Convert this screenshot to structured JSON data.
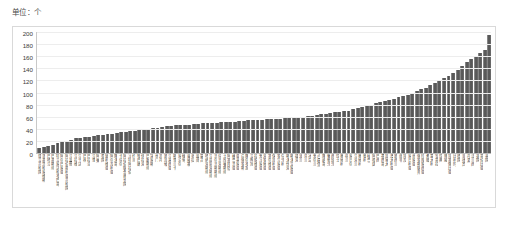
{
  "unit": {
    "label": "单位：个"
  },
  "chart_data": {
    "type": "bar",
    "title": "",
    "subtitle": "",
    "xlabel": "",
    "ylabel": "",
    "unit_note": "单位：个",
    "ylim": [
      0,
      200
    ],
    "yticks": [
      200,
      180,
      160,
      140,
      120,
      100,
      80,
      60,
      40,
      20,
      0
    ],
    "grid": true,
    "legend": "none",
    "bar_color": "#4e4e4e",
    "sorted": "ascending",
    "categories": [
      "建立共和国",
      "圣基茨和尼维斯",
      "巴哈马",
      "巴基斯坦",
      "特立尼达和多巴哥",
      "阿尔巴尼亚",
      "阿拉伯叙利亚共和国",
      "马耳他",
      "马拉维",
      "乌干达",
      "巴林",
      "巴拉圭",
      "马里",
      "阿曼",
      "泰国",
      "玻利维亚",
      "阿尔及利亚",
      "摩洛哥",
      "卡塔尔",
      "阿拉伯联合酋长国",
      "沙特阿拉伯",
      "约旦",
      "黎巴嫩",
      "伊拉克",
      "巴勒斯坦",
      "突尼斯",
      "也门",
      "苏丹",
      "新加坡",
      "马来西亚",
      "斯里兰卡",
      "尼泊尔",
      "缅甸",
      "柬埔寨",
      "老挝",
      "越南",
      "蒙古",
      "哈萨克斯坦",
      "乌兹别克斯坦",
      "吉尔吉斯斯坦",
      "塔吉克斯坦",
      "土库曼斯坦",
      "阿塞拜疆",
      "格鲁吉亚",
      "亚美尼亚",
      "白俄罗斯",
      "摩尔多瓦",
      "立陶宛",
      "拉脱维亚",
      "爱沙尼亚",
      "克罗地亚",
      "塞尔维亚",
      "保加利亚",
      "罗马尼亚",
      "匈牙利",
      "斯洛伐克",
      "斯洛文尼亚",
      "捷克",
      "波兰",
      "芬兰",
      "冰岛",
      "爱尔兰",
      "卢森堡",
      "摩纳哥",
      "葡萄牙",
      "西班牙",
      "瑞士",
      "奥地利",
      "荷兰",
      "尼日尔",
      "乌克兰",
      "奥地利",
      "智利",
      "秘鲁",
      "阿根廷",
      "巴西",
      "墨西哥",
      "加拿大",
      "澳大利亚",
      "新西兰",
      "南非",
      "埃及",
      "尼日利亚",
      "肯尼亚",
      "俄罗斯联邦",
      "印度尼西亚",
      "希腊",
      "意大利",
      "安哥拉",
      "瑞典",
      "挪威",
      "埃塞俄比亚",
      "比利时",
      "德国",
      "菲律宾",
      "丹麦",
      "法兰西",
      "英国",
      "哥伦比亚",
      "美国"
    ],
    "values": [
      8,
      10,
      12,
      14,
      16,
      18,
      20,
      22,
      24,
      25,
      26,
      27,
      28,
      29,
      30,
      31,
      32,
      33,
      34,
      35,
      36,
      37,
      38,
      39,
      40,
      41,
      42,
      43,
      44,
      45,
      46,
      46,
      47,
      47,
      48,
      48,
      49,
      49,
      50,
      50,
      51,
      51,
      52,
      52,
      53,
      53,
      54,
      54,
      55,
      55,
      56,
      56,
      57,
      57,
      58,
      58,
      59,
      60,
      60,
      61,
      62,
      63,
      64,
      65,
      66,
      67,
      68,
      69,
      70,
      72,
      74,
      76,
      78,
      80,
      82,
      84,
      86,
      88,
      90,
      92,
      94,
      96,
      99,
      102,
      105,
      108,
      112,
      116,
      120,
      124,
      128,
      133,
      138,
      144,
      150,
      155,
      160,
      165,
      170,
      195
    ]
  }
}
